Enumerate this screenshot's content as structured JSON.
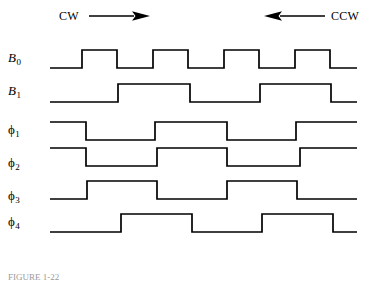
{
  "figure": {
    "type": "timing-diagram",
    "background_color": "#ffffff",
    "line_color": "#000000",
    "caption": "FIGURE 1-22"
  },
  "header": {
    "cw": {
      "label": "CW",
      "arrow_icon": "arrow-right-icon",
      "direction": "right"
    },
    "ccw": {
      "label": "CCW",
      "arrow_icon": "arrow-left-icon",
      "direction": "left"
    }
  },
  "signals": [
    {
      "key": "b0",
      "label": "B",
      "subscript": "0",
      "italic": true
    },
    {
      "key": "b1",
      "label": "B",
      "subscript": "1",
      "italic": true
    },
    {
      "key": "p1",
      "label": "ϕ",
      "subscript": "1",
      "italic": false
    },
    {
      "key": "p2",
      "label": "ϕ",
      "subscript": "2",
      "italic": false
    },
    {
      "key": "p3",
      "label": "ϕ",
      "subscript": "3",
      "italic": false
    },
    {
      "key": "p4",
      "label": "ϕ",
      "subscript": "4",
      "italic": false
    }
  ],
  "chart_data": {
    "type": "line",
    "title": "",
    "xlabel": "",
    "ylabel": "",
    "grid": false,
    "legend_position": "none",
    "x_start": 50,
    "x_end": 357,
    "series": [
      {
        "name": "B0",
        "row_top": 46,
        "high_y": 50,
        "low_y": 68,
        "initial_level": 0,
        "transitions": [
          82,
          117,
          153,
          188,
          224,
          259,
          295,
          330
        ],
        "pulse_count": 4
      },
      {
        "name": "B1",
        "row_top": 80,
        "high_y": 84,
        "low_y": 102,
        "initial_level": 0,
        "transitions": [
          118,
          190,
          260,
          331
        ],
        "pulse_count": 2
      },
      {
        "name": "phi1",
        "row_top": 118,
        "high_y": 122,
        "low_y": 140,
        "initial_level": 1,
        "transitions": [
          86,
          155,
          227,
          296
        ],
        "pulse_count": 2
      },
      {
        "name": "phi2",
        "row_top": 144,
        "high_y": 148,
        "low_y": 166,
        "initial_level": 1,
        "transitions": [
          86,
          157,
          227,
          300
        ],
        "pulse_count": 2
      },
      {
        "name": "phi3",
        "row_top": 177,
        "high_y": 181,
        "low_y": 199,
        "initial_level": 0,
        "transitions": [
          87,
          157,
          227,
          297
        ],
        "pulse_count": 2
      },
      {
        "name": "phi4",
        "row_top": 210,
        "high_y": 214,
        "low_y": 232,
        "initial_level": 0,
        "transitions": [
          121,
          192,
          262,
          333
        ],
        "pulse_count": 2
      }
    ]
  }
}
